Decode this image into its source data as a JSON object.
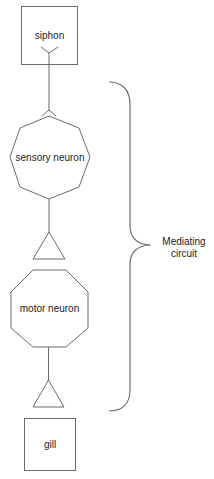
{
  "diagram": {
    "nodes": [
      {
        "id": "siphon",
        "label": "siphon",
        "shape": "box"
      },
      {
        "id": "sensory",
        "label": "sensory neuron",
        "shape": "octagon"
      },
      {
        "id": "synapse1",
        "label": "",
        "shape": "triangle"
      },
      {
        "id": "motor",
        "label": "motor neuron",
        "shape": "octagon"
      },
      {
        "id": "synapse2",
        "label": "",
        "shape": "triangle"
      },
      {
        "id": "gill",
        "label": "gill",
        "shape": "box"
      }
    ],
    "brace_label_line1": "Mediating",
    "brace_label_line2": "circuit",
    "colors": {
      "stroke": "#6b6b6b",
      "text": "#222222",
      "background": "#ffffff"
    }
  }
}
